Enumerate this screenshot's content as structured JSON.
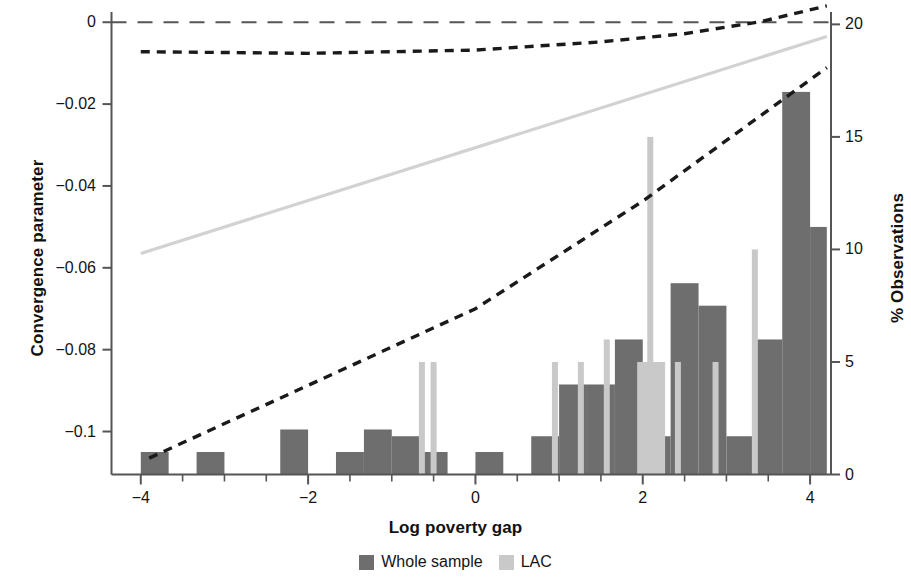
{
  "chart_data": {
    "type": "bar",
    "title": "",
    "xlabel": "Log poverty gap",
    "ylabel_left": "Convergence parameter",
    "ylabel_right": "% Observations",
    "xlim": [
      -4.35,
      4.25
    ],
    "ylim_left": [
      -0.1105,
      0.0025
    ],
    "ylim_right": [
      0,
      20.55
    ],
    "grid": false,
    "legend_position": "bottom-center",
    "x_ticks": [
      -4,
      -2,
      0,
      2,
      4
    ],
    "x_tick_labels": [
      "−4",
      "−2",
      "0",
      "2",
      "4"
    ],
    "x_minor_ticks": [
      -3.5,
      -3,
      -2.5,
      -1.5,
      -1,
      -0.5,
      0.5,
      1,
      1.5,
      2.5,
      3,
      3.5
    ],
    "y_left_ticks": [
      0,
      -0.02,
      -0.04,
      -0.06,
      -0.08,
      -0.1
    ],
    "y_left_tick_labels": [
      "0",
      "−0.02",
      "−0.04",
      "−0.06",
      "−0.08",
      "−0.1"
    ],
    "y_right_ticks": [
      0,
      5,
      10,
      15,
      20
    ],
    "y_right_tick_labels": [
      "0",
      "5",
      "10",
      "15",
      "20"
    ],
    "colors": {
      "whole_sample": "#6e6e6e",
      "lac": "#c9c9c9",
      "fit_line": "#d2d2d2",
      "confidence_band": "#1a1a1a",
      "zero_line": "#555555",
      "axis": "#555555"
    },
    "series": [
      {
        "name": "Whole sample",
        "kind": "histogram",
        "axis": "right",
        "color": "#6e6e6e",
        "bin_width": 0.3333,
        "bins": [
          {
            "x0": -4.0,
            "x1": -3.667,
            "value": 1.0
          },
          {
            "x0": -3.333,
            "x1": -3.0,
            "value": 1.0
          },
          {
            "x0": -2.333,
            "x1": -2.0,
            "value": 2.0
          },
          {
            "x0": -1.667,
            "x1": -1.333,
            "value": 1.0
          },
          {
            "x0": -1.333,
            "x1": -1.0,
            "value": 2.0
          },
          {
            "x0": -1.0,
            "x1": -0.667,
            "value": 1.7
          },
          {
            "x0": -0.667,
            "x1": -0.333,
            "value": 1.0
          },
          {
            "x0": -0.333,
            "x1": 0.0,
            "value": 0.0
          },
          {
            "x0": 0.0,
            "x1": 0.333,
            "value": 1.0
          },
          {
            "x0": 0.333,
            "x1": 0.667,
            "value": 0.0
          },
          {
            "x0": 0.667,
            "x1": 1.0,
            "value": 1.7
          },
          {
            "x0": 1.0,
            "x1": 1.333,
            "value": 4.0
          },
          {
            "x0": 1.333,
            "x1": 1.667,
            "value": 4.0
          },
          {
            "x0": 1.667,
            "x1": 2.0,
            "value": 6.0
          },
          {
            "x0": 2.0,
            "x1": 2.333,
            "value": 1.7
          },
          {
            "x0": 2.333,
            "x1": 2.667,
            "value": 8.5
          },
          {
            "x0": 2.667,
            "x1": 3.0,
            "value": 7.5
          },
          {
            "x0": 3.0,
            "x1": 3.333,
            "value": 1.7
          },
          {
            "x0": 3.333,
            "x1": 3.667,
            "value": 6.0
          },
          {
            "x0": 3.667,
            "x1": 4.0,
            "value": 17.0
          },
          {
            "x0": 4.0,
            "x1": 4.2,
            "value": 11.0
          }
        ]
      },
      {
        "name": "LAC",
        "kind": "histogram",
        "axis": "right",
        "color": "#c9c9c9",
        "bin_width": 0.3333,
        "bins": [
          {
            "x0": 1.933,
            "x1": 2.267,
            "value": 5.0
          }
        ],
        "spikes": [
          {
            "x": -0.64,
            "value": 5.0
          },
          {
            "x": -0.5,
            "value": 5.0
          },
          {
            "x": 0.95,
            "value": 5.0
          },
          {
            "x": 1.26,
            "value": 5.0
          },
          {
            "x": 1.57,
            "value": 6.0
          },
          {
            "x": 2.09,
            "value": 15.0
          },
          {
            "x": 2.42,
            "value": 5.0
          },
          {
            "x": 2.87,
            "value": 5.0
          },
          {
            "x": 3.34,
            "value": 10.0
          }
        ]
      },
      {
        "name": "Fitted regression line",
        "kind": "line",
        "axis": "left",
        "color": "#d2d2d2",
        "style": "solid",
        "points": [
          {
            "x": -4.0,
            "y": -0.0565
          },
          {
            "x": 4.2,
            "y": -0.0035
          }
        ]
      },
      {
        "name": "Upper confidence bound",
        "kind": "line",
        "axis": "left",
        "color": "#1a1a1a",
        "style": "dashed",
        "points": [
          {
            "x": -4.0,
            "y": -0.0072
          },
          {
            "x": -2.0,
            "y": -0.0076
          },
          {
            "x": 0.0,
            "y": -0.0068
          },
          {
            "x": 1.5,
            "y": -0.0048
          },
          {
            "x": 2.5,
            "y": -0.0028
          },
          {
            "x": 3.4,
            "y": 0.0001
          },
          {
            "x": 4.2,
            "y": 0.004
          }
        ]
      },
      {
        "name": "Lower confidence bound",
        "kind": "line",
        "axis": "left",
        "color": "#1a1a1a",
        "style": "dashed",
        "points": [
          {
            "x": -3.9,
            "y": -0.1065
          },
          {
            "x": 0.0,
            "y": -0.07
          },
          {
            "x": 2.0,
            "y": -0.0437
          },
          {
            "x": 4.2,
            "y": -0.0111
          }
        ]
      },
      {
        "name": "Zero reference line",
        "kind": "line",
        "axis": "left",
        "color": "#555555",
        "style": "long-dashed",
        "points": [
          {
            "x": -4.35,
            "y": 0
          },
          {
            "x": 4.25,
            "y": 0
          }
        ]
      }
    ],
    "legend": [
      {
        "label": "Whole sample",
        "color": "#6e6e6e"
      },
      {
        "label": "LAC",
        "color": "#c9c9c9"
      }
    ]
  }
}
